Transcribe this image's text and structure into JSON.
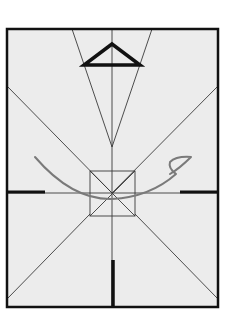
{
  "diagram": {
    "background": "#ffffff",
    "paper_fill": "#ececec",
    "frame": {
      "x": 7,
      "y": 29,
      "width": 211,
      "height": 278,
      "stroke": "#111111",
      "stroke_width": 2.5
    },
    "thin_lines_color": "#333333",
    "thick_lines_color": "#111111",
    "curve_color": "#777777",
    "center": {
      "x": 112,
      "y": 193
    },
    "center_square": {
      "x": 90,
      "y": 171,
      "size": 45
    },
    "funnel_apex": {
      "x": 112,
      "y": 147
    },
    "top_triangle": {
      "apex": [
        112,
        44
      ],
      "left": [
        84,
        65
      ],
      "right": [
        140,
        65
      ]
    }
  }
}
